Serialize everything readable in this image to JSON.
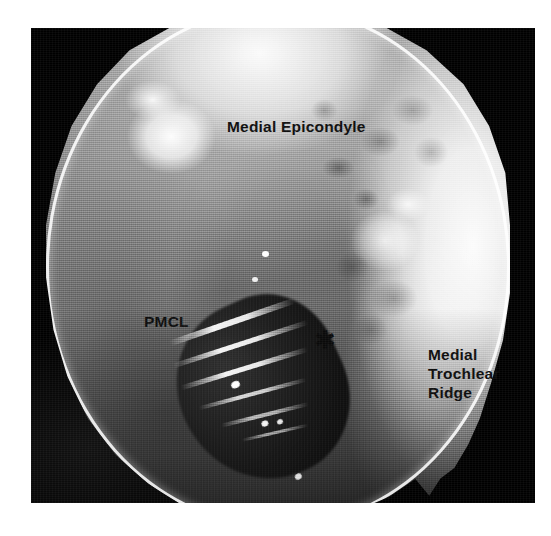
{
  "figure": {
    "kind": "arthroscopic-photograph",
    "view": "medial elbow arthroscopy",
    "frame_color": "#000000",
    "page_background": "#ffffff",
    "label_color": "#0d0d0d"
  },
  "annotations": {
    "medial_epicondyle": "Medial Epicondyle",
    "pmcl": "PMCL",
    "medial_trochlear_ridge": "Medial\nTrochlear\nRidge",
    "asterisk_marker": "✱"
  },
  "structures": [
    {
      "name": "medial-epicondyle",
      "label": "Medial Epicondyle",
      "position": "top-center"
    },
    {
      "name": "pmcl",
      "label": "PMCL",
      "position": "mid-left"
    },
    {
      "name": "medial-trochlear-ridge",
      "label": "Medial Trochlear Ridge",
      "position": "mid-right"
    },
    {
      "name": "asterisk-region",
      "label": "✱",
      "position": "center"
    }
  ]
}
